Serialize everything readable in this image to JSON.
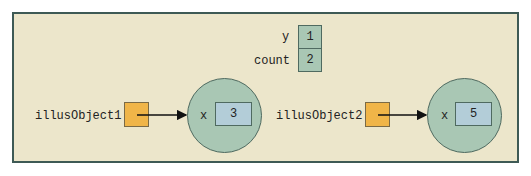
{
  "diagram": {
    "static_fields": [
      {
        "name": "y",
        "value": "1"
      },
      {
        "name": "count",
        "value": "2"
      }
    ],
    "objects": [
      {
        "reference": "illusObject1",
        "field": "x",
        "value": "3"
      },
      {
        "reference": "illusObject2",
        "field": "x",
        "value": "5"
      }
    ],
    "colors": {
      "background": "#ece6cb",
      "border": "#3e5a55",
      "reference_box": "#f0b548",
      "object_circle": "#a9c7b4",
      "value_box": "#b3cdd8"
    }
  }
}
